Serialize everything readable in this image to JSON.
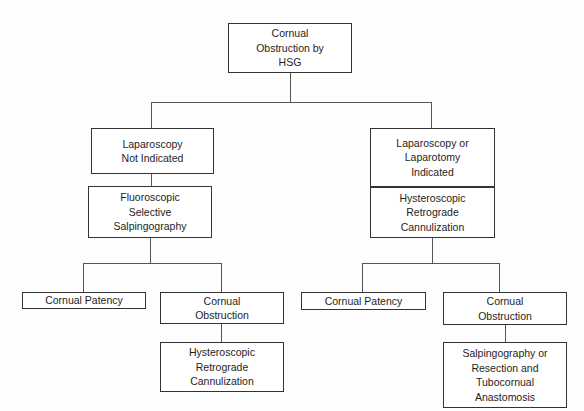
{
  "diagram": {
    "type": "flowchart",
    "nodes": {
      "root": {
        "label": "Cornual\nObstruction by\nHSG"
      },
      "left_1": {
        "label": "Laparoscopy\nNot Indicated"
      },
      "right_1": {
        "label": "Laparoscopy or\nLaparotomy\nIndicated"
      },
      "left_2": {
        "label": "Fluoroscopic\nSelective\nSalpingography"
      },
      "right_2": {
        "label": "Hysteroscopic\nRetrograde\nCannulization"
      },
      "left_patency": {
        "label": "Cornual Patency"
      },
      "left_obstruction": {
        "label": "Cornual\nObstruction"
      },
      "right_patency": {
        "label": "Cornual Patency"
      },
      "right_obstruction": {
        "label": "Cornual\nObstruction"
      },
      "left_final": {
        "label": "Hysteroscopic\nRetrograde\nCannulization"
      },
      "right_final": {
        "label": "Salpingography or\nResection and\nTubocornual\nAnastomosis"
      }
    },
    "edges": [
      [
        "root",
        "left_1"
      ],
      [
        "root",
        "right_1"
      ],
      [
        "left_1",
        "left_2"
      ],
      [
        "right_1",
        "right_2"
      ],
      [
        "left_2",
        "left_patency"
      ],
      [
        "left_2",
        "left_obstruction"
      ],
      [
        "right_2",
        "right_patency"
      ],
      [
        "right_2",
        "right_obstruction"
      ],
      [
        "left_obstruction",
        "left_final"
      ],
      [
        "right_obstruction",
        "right_final"
      ]
    ]
  }
}
